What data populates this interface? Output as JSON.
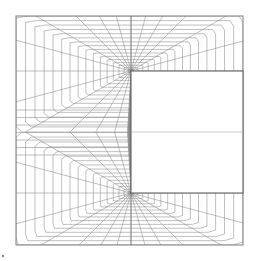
{
  "figure": {
    "kind": "structured computational mesh",
    "mesh": {
      "radial_lines_per_corner": 18,
      "arc_lines_per_corner": 16,
      "line_color": "#8a8a8a",
      "boundary_color": "#6f6f6f",
      "obstacle_edge_color": "#555555",
      "centerline_color": "#b5b5b5"
    },
    "regions": [
      {
        "name": "fluid-domain",
        "fill": "#ffffff"
      },
      {
        "name": "obstacle",
        "fill": "#ffffff"
      }
    ]
  }
}
